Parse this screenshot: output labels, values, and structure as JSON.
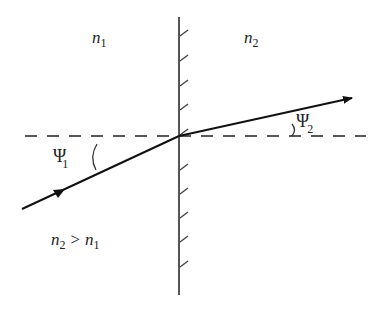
{
  "diagram": {
    "regions": {
      "left_medium": {
        "symbol": "n",
        "subscript": "1"
      },
      "right_medium": {
        "symbol": "n",
        "subscript": "2"
      }
    },
    "condition": {
      "lhs_symbol": "n",
      "lhs_subscript": "2",
      "relation": ">",
      "rhs_symbol": "n",
      "rhs_subscript": "1"
    },
    "angles": {
      "incident": {
        "symbol": "Ψ",
        "subscript": "1"
      },
      "refracted": {
        "symbol": "Ψ",
        "subscript": "2"
      }
    },
    "elements": [
      "interface-boundary (hatched vertical line)",
      "horizontal dashed reference line",
      "incident ray with arrow",
      "refracted ray with arrow"
    ],
    "colors": {
      "ink": "#222222",
      "interface": "#555555",
      "background": "#ffffff"
    }
  }
}
